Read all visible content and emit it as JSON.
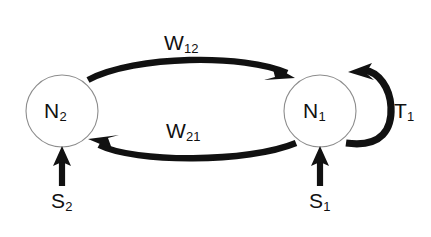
{
  "diagram": {
    "type": "network-graph",
    "background_color": "#ffffff",
    "stroke_color": "#111111",
    "node_outline_color": "#8d8d8d",
    "node_fill_color": "#ffffff",
    "nodes": [
      {
        "id": "N2",
        "label": "N",
        "subscript": "2",
        "cx": 62,
        "cy": 111,
        "r": 36
      },
      {
        "id": "N1",
        "label": "N",
        "subscript": "1",
        "cx": 320,
        "cy": 111,
        "r": 36
      }
    ],
    "edges": [
      {
        "id": "W12",
        "label": "W",
        "subscript": "12",
        "from": "N2",
        "to": "N1",
        "direction": "left-to-right",
        "shape": "arc-above"
      },
      {
        "id": "W21",
        "label": "W",
        "subscript": "21",
        "from": "N1",
        "to": "N2",
        "direction": "right-to-left",
        "shape": "arc-below"
      },
      {
        "id": "T1",
        "label": "T",
        "subscript": "1",
        "from": "N1",
        "to": "N1",
        "direction": "self-loop",
        "shape": "loop-right"
      }
    ],
    "inputs": [
      {
        "id": "S2",
        "label": "S",
        "subscript": "2",
        "target": "N2",
        "direction": "upward"
      },
      {
        "id": "S1",
        "label": "S",
        "subscript": "1",
        "target": "N1",
        "direction": "upward"
      }
    ]
  }
}
